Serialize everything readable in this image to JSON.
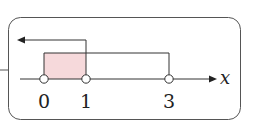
{
  "diagram": {
    "type": "number-line-intervals",
    "axis_label": "x",
    "ticks": [
      {
        "value": 0,
        "label": "0",
        "open": true
      },
      {
        "value": 1,
        "label": "1",
        "open": true
      },
      {
        "value": 3,
        "label": "3",
        "open": true
      }
    ],
    "intervals": [
      {
        "description": "x < 1",
        "from": "-inf",
        "to": 1,
        "style": "arrow-left"
      },
      {
        "description": "0 < x < 3",
        "from": 0,
        "to": 3,
        "style": "bracket"
      }
    ],
    "shaded_region": {
      "from": 0,
      "to": 1,
      "color": "#f6d9db"
    },
    "colors": {
      "stroke": "#333333",
      "shade": "#f6d9db",
      "border": "#555555"
    }
  }
}
